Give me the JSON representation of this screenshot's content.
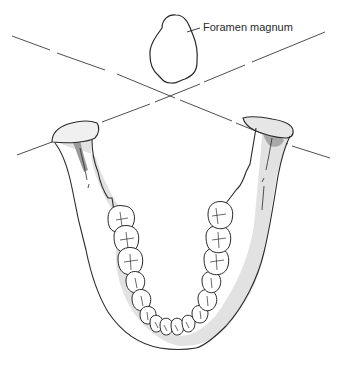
{
  "diagram": {
    "type": "anatomical-illustration",
    "labels": {
      "foramen_magnum": "Foramen magnum"
    },
    "colors": {
      "outline": "#2a2a2a",
      "bone_shade": "#d9d9d9",
      "dark_shade": "#9a9a9a",
      "background": "#ffffff"
    }
  }
}
